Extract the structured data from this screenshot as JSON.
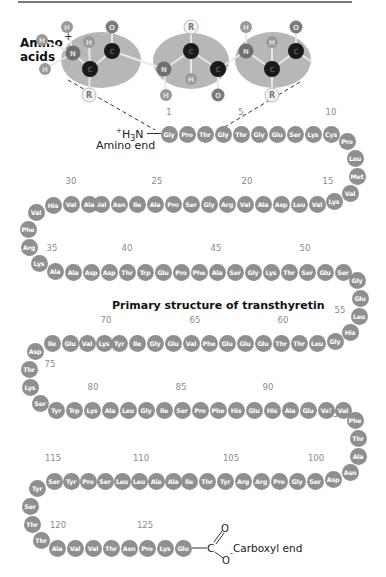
{
  "figure": {
    "heading_line1": "Amino",
    "heading_line2": "acids",
    "title": "Primary structure of transthyretin",
    "amino_end_prefix": "+",
    "amino_end_formula_h": "H",
    "amino_end_formula_sub": "3",
    "amino_end_formula_n": "N",
    "amino_end_label": "Amino end",
    "carboxyl_end_label": "Carboxyl end",
    "carboxyl_C": "C",
    "carboxyl_O_double": "O",
    "carboxyl_O_single": "O",
    "carboxyl_charge": "-",
    "colors": {
      "residue": "#8f8f8f",
      "residue_text": "#ffffff",
      "number_label": "#8a8a8a",
      "ellipse": "#b7b7b7",
      "carbon": "#1a1a1a",
      "nitrogen": "#6f6f6f",
      "oxygen": "#7a7a7a",
      "hydrogen": "#9a9a9a",
      "r_group": "#f2f2f2"
    }
  },
  "molecule": {
    "atoms": [
      {
        "label": "H",
        "type": "hydrogen",
        "x": 42,
        "y": 40
      },
      {
        "label": "H",
        "type": "hydrogen",
        "x": 67,
        "y": 27
      },
      {
        "label": "H",
        "type": "hydrogen",
        "x": 45,
        "y": 69
      },
      {
        "label": "N",
        "type": "nitrogen",
        "x": 73,
        "y": 53
      },
      {
        "label": "H",
        "type": "hydrogen",
        "x": 89,
        "y": 42
      },
      {
        "label": "C",
        "type": "carbon",
        "x": 90,
        "y": 69
      },
      {
        "label": "R",
        "type": "r_group",
        "x": 89,
        "y": 95
      },
      {
        "label": "C",
        "type": "carbon",
        "x": 112,
        "y": 51
      },
      {
        "label": "O",
        "type": "oxygen",
        "x": 112,
        "y": 27
      },
      {
        "label": "N",
        "type": "nitrogen",
        "x": 164,
        "y": 69
      },
      {
        "label": "H",
        "type": "hydrogen",
        "x": 166,
        "y": 95
      },
      {
        "label": "C",
        "type": "carbon",
        "x": 191,
        "y": 51
      },
      {
        "label": "R",
        "type": "r_group",
        "x": 191,
        "y": 27
      },
      {
        "label": "H",
        "type": "hydrogen",
        "x": 191,
        "y": 79
      },
      {
        "label": "C",
        "type": "carbon",
        "x": 218,
        "y": 69
      },
      {
        "label": "O",
        "type": "oxygen",
        "x": 218,
        "y": 95
      },
      {
        "label": "N",
        "type": "nitrogen",
        "x": 246,
        "y": 51
      },
      {
        "label": "H",
        "type": "hydrogen",
        "x": 246,
        "y": 27
      },
      {
        "label": "H",
        "type": "hydrogen",
        "x": 272,
        "y": 42
      },
      {
        "label": "C",
        "type": "carbon",
        "x": 272,
        "y": 69
      },
      {
        "label": "R",
        "type": "r_group",
        "x": 272,
        "y": 95
      },
      {
        "label": "C",
        "type": "carbon",
        "x": 296,
        "y": 51
      },
      {
        "label": "O",
        "type": "oxygen",
        "x": 296,
        "y": 27
      }
    ],
    "charge": "+"
  },
  "sequence": [
    {
      "n": 1,
      "aa": "Gly",
      "x": 169,
      "y": 134
    },
    {
      "n": 2,
      "aa": "Pro",
      "x": 187,
      "y": 134
    },
    {
      "n": 3,
      "aa": "Thr",
      "x": 205,
      "y": 134
    },
    {
      "n": 4,
      "aa": "Gly",
      "x": 223,
      "y": 134
    },
    {
      "n": 5,
      "aa": "Thr",
      "x": 241,
      "y": 134
    },
    {
      "n": 6,
      "aa": "Gly",
      "x": 259,
      "y": 134
    },
    {
      "n": 7,
      "aa": "Glu",
      "x": 277,
      "y": 134
    },
    {
      "n": 8,
      "aa": "Ser",
      "x": 295,
      "y": 134
    },
    {
      "n": 9,
      "aa": "Lys",
      "x": 313,
      "y": 134
    },
    {
      "n": 10,
      "aa": "Cys",
      "x": 331,
      "y": 134
    },
    {
      "n": 11,
      "aa": "Pro",
      "x": 347,
      "y": 141
    },
    {
      "n": 12,
      "aa": "Leu",
      "x": 355,
      "y": 158
    },
    {
      "n": 13,
      "aa": "Met",
      "x": 357,
      "y": 176
    },
    {
      "n": 14,
      "aa": "Val",
      "x": 350,
      "y": 193
    },
    {
      "n": 15,
      "aa": "Lys",
      "x": 334,
      "y": 201
    },
    {
      "n": 16,
      "aa": "Val",
      "x": 317,
      "y": 204
    },
    {
      "n": 17,
      "aa": "Leu",
      "x": 299,
      "y": 204
    },
    {
      "n": 18,
      "aa": "Asp",
      "x": 281,
      "y": 204
    },
    {
      "n": 19,
      "aa": "Ala",
      "x": 263,
      "y": 204
    },
    {
      "n": 20,
      "aa": "Val",
      "x": 245,
      "y": 204
    },
    {
      "n": 21,
      "aa": "Arg",
      "x": 227,
      "y": 204
    },
    {
      "n": 22,
      "aa": "Gly",
      "x": 209,
      "y": 204
    },
    {
      "n": 23,
      "aa": "Ser",
      "x": 191,
      "y": 204
    },
    {
      "n": 24,
      "aa": "Pro",
      "x": 173,
      "y": 204
    },
    {
      "n": 25,
      "aa": "Ala",
      "x": 155,
      "y": 204
    },
    {
      "n": 26,
      "aa": "Ile",
      "x": 137,
      "y": 204
    },
    {
      "n": 27,
      "aa": "Asn",
      "x": 119,
      "y": 204
    },
    {
      "n": 28,
      "aa": "Val",
      "x": 101,
      "y": 204
    },
    {
      "n": 29,
      "aa": "Ala",
      "x": 89,
      "y": 204
    },
    {
      "n": 30,
      "aa": "Val",
      "x": 71,
      "y": 204
    },
    {
      "n": 31,
      "aa": "His",
      "x": 53,
      "y": 205
    },
    {
      "n": 32,
      "aa": "Val",
      "x": 36,
      "y": 212
    },
    {
      "n": 33,
      "aa": "Phe",
      "x": 28,
      "y": 229
    },
    {
      "n": 34,
      "aa": "Arg",
      "x": 29,
      "y": 247
    },
    {
      "n": 35,
      "aa": "Lys",
      "x": 39,
      "y": 263
    },
    {
      "n": 36,
      "aa": "Ala",
      "x": 55,
      "y": 271
    },
    {
      "n": 37,
      "aa": "Ala",
      "x": 73,
      "y": 272
    },
    {
      "n": 38,
      "aa": "Asp",
      "x": 91,
      "y": 272
    },
    {
      "n": 39,
      "aa": "Asp",
      "x": 109,
      "y": 272
    },
    {
      "n": 40,
      "aa": "Thr",
      "x": 127,
      "y": 272
    },
    {
      "n": 41,
      "aa": "Trp",
      "x": 145,
      "y": 272
    },
    {
      "n": 42,
      "aa": "Glu",
      "x": 163,
      "y": 272
    },
    {
      "n": 43,
      "aa": "Pro",
      "x": 181,
      "y": 272
    },
    {
      "n": 44,
      "aa": "Phe",
      "x": 199,
      "y": 272
    },
    {
      "n": 45,
      "aa": "Ala",
      "x": 217,
      "y": 272
    },
    {
      "n": 46,
      "aa": "Ser",
      "x": 235,
      "y": 272
    },
    {
      "n": 47,
      "aa": "Gly",
      "x": 253,
      "y": 272
    },
    {
      "n": 48,
      "aa": "Lys",
      "x": 271,
      "y": 272
    },
    {
      "n": 49,
      "aa": "Thr",
      "x": 289,
      "y": 272
    },
    {
      "n": 50,
      "aa": "Ser",
      "x": 307,
      "y": 272
    },
    {
      "n": 51,
      "aa": "Glu",
      "x": 325,
      "y": 272
    },
    {
      "n": 52,
      "aa": "Ser",
      "x": 343,
      "y": 272
    },
    {
      "n": 53,
      "aa": "Gly",
      "x": 357,
      "y": 280
    },
    {
      "n": 54,
      "aa": "Glu",
      "x": 360,
      "y": 298
    },
    {
      "n": 55,
      "aa": "Leu",
      "x": 359,
      "y": 316
    },
    {
      "n": 56,
      "aa": "His",
      "x": 350,
      "y": 332
    },
    {
      "n": 57,
      "aa": "Gly",
      "x": 335,
      "y": 341
    },
    {
      "n": 58,
      "aa": "Leu",
      "x": 317,
      "y": 343
    },
    {
      "n": 59,
      "aa": "Thr",
      "x": 299,
      "y": 343
    },
    {
      "n": 60,
      "aa": "Thr",
      "x": 281,
      "y": 343
    },
    {
      "n": 61,
      "aa": "Glu",
      "x": 263,
      "y": 343
    },
    {
      "n": 62,
      "aa": "Glu",
      "x": 245,
      "y": 343
    },
    {
      "n": 63,
      "aa": "Glu",
      "x": 227,
      "y": 343
    },
    {
      "n": 64,
      "aa": "Phe",
      "x": 209,
      "y": 343
    },
    {
      "n": 65,
      "aa": "Val",
      "x": 191,
      "y": 343
    },
    {
      "n": 66,
      "aa": "Glu",
      "x": 173,
      "y": 343
    },
    {
      "n": 67,
      "aa": "Gly",
      "x": 155,
      "y": 343
    },
    {
      "n": 68,
      "aa": "Ile",
      "x": 137,
      "y": 343
    },
    {
      "n": 69,
      "aa": "Tyr",
      "x": 119,
      "y": 343
    },
    {
      "n": 70,
      "aa": "Lys",
      "x": 104,
      "y": 343
    },
    {
      "n": 71,
      "aa": "Val",
      "x": 87,
      "y": 343
    },
    {
      "n": 72,
      "aa": "Glu",
      "x": 70,
      "y": 343
    },
    {
      "n": 73,
      "aa": "Ile",
      "x": 52,
      "y": 343
    },
    {
      "n": 74,
      "aa": "Asp",
      "x": 35,
      "y": 351
    },
    {
      "n": 75,
      "aa": "Thr",
      "x": 29,
      "y": 369
    },
    {
      "n": 76,
      "aa": "Lys",
      "x": 30,
      "y": 387
    },
    {
      "n": 77,
      "aa": "Ser",
      "x": 40,
      "y": 403
    },
    {
      "n": 78,
      "aa": "Tyr",
      "x": 56,
      "y": 410
    },
    {
      "n": 79,
      "aa": "Trp",
      "x": 74,
      "y": 410
    },
    {
      "n": 80,
      "aa": "Lys",
      "x": 92,
      "y": 410
    },
    {
      "n": 81,
      "aa": "Ala",
      "x": 110,
      "y": 410
    },
    {
      "n": 82,
      "aa": "Leu",
      "x": 128,
      "y": 410
    },
    {
      "n": 83,
      "aa": "Gly",
      "x": 146,
      "y": 410
    },
    {
      "n": 84,
      "aa": "Ile",
      "x": 164,
      "y": 410
    },
    {
      "n": 85,
      "aa": "Ser",
      "x": 182,
      "y": 410
    },
    {
      "n": 86,
      "aa": "Pro",
      "x": 200,
      "y": 410
    },
    {
      "n": 87,
      "aa": "Phe",
      "x": 218,
      "y": 410
    },
    {
      "n": 88,
      "aa": "His",
      "x": 236,
      "y": 410
    },
    {
      "n": 89,
      "aa": "Glu",
      "x": 254,
      "y": 410
    },
    {
      "n": 90,
      "aa": "His",
      "x": 272,
      "y": 410
    },
    {
      "n": 91,
      "aa": "Ala",
      "x": 290,
      "y": 410
    },
    {
      "n": 92,
      "aa": "Glu",
      "x": 308,
      "y": 410
    },
    {
      "n": 93,
      "aa": "Val",
      "x": 326,
      "y": 410
    },
    {
      "n": 94,
      "aa": "Val",
      "x": 343,
      "y": 410
    },
    {
      "n": 95,
      "aa": "Phe",
      "x": 355,
      "y": 420
    },
    {
      "n": 96,
      "aa": "Thr",
      "x": 358,
      "y": 438
    },
    {
      "n": 97,
      "aa": "Ala",
      "x": 358,
      "y": 456
    },
    {
      "n": 98,
      "aa": "Asn",
      "x": 350,
      "y": 472
    },
    {
      "n": 99,
      "aa": "Asp",
      "x": 333,
      "y": 479
    },
    {
      "n": 100,
      "aa": "Ser",
      "x": 315,
      "y": 481
    },
    {
      "n": 101,
      "aa": "Gly",
      "x": 297,
      "y": 481
    },
    {
      "n": 102,
      "aa": "Pro",
      "x": 279,
      "y": 481
    },
    {
      "n": 103,
      "aa": "Arg",
      "x": 261,
      "y": 481
    },
    {
      "n": 104,
      "aa": "Arg",
      "x": 243,
      "y": 481
    },
    {
      "n": 105,
      "aa": "Tyr",
      "x": 225,
      "y": 481
    },
    {
      "n": 106,
      "aa": "Thr",
      "x": 207,
      "y": 481
    },
    {
      "n": 107,
      "aa": "Ile",
      "x": 189,
      "y": 481
    },
    {
      "n": 108,
      "aa": "Ala",
      "x": 173,
      "y": 481
    },
    {
      "n": 109,
      "aa": "Ala",
      "x": 156,
      "y": 481
    },
    {
      "n": 110,
      "aa": "Leu",
      "x": 139,
      "y": 481
    },
    {
      "n": 111,
      "aa": "Leu",
      "x": 122,
      "y": 481
    },
    {
      "n": 112,
      "aa": "Ser",
      "x": 105,
      "y": 481
    },
    {
      "n": 113,
      "aa": "Pro",
      "x": 88,
      "y": 481
    },
    {
      "n": 114,
      "aa": "Tyr",
      "x": 71,
      "y": 481
    },
    {
      "n": 115,
      "aa": "Ser",
      "x": 54,
      "y": 481
    },
    {
      "n": 116,
      "aa": "Tyr",
      "x": 37,
      "y": 488
    },
    {
      "n": 117,
      "aa": "Ser",
      "x": 30,
      "y": 506
    },
    {
      "n": 118,
      "aa": "Thr",
      "x": 32,
      "y": 524
    },
    {
      "n": 119,
      "aa": "Thr",
      "x": 41,
      "y": 540
    },
    {
      "n": 120,
      "aa": "Ala",
      "x": 57,
      "y": 548
    },
    {
      "n": 121,
      "aa": "Val",
      "x": 75,
      "y": 548
    },
    {
      "n": 122,
      "aa": "Val",
      "x": 93,
      "y": 548
    },
    {
      "n": 123,
      "aa": "Thr",
      "x": 111,
      "y": 548
    },
    {
      "n": 124,
      "aa": "Asn",
      "x": 129,
      "y": 548
    },
    {
      "n": 125,
      "aa": "Pro",
      "x": 147,
      "y": 548
    },
    {
      "n": 126,
      "aa": "Lys",
      "x": 165,
      "y": 548
    },
    {
      "n": 127,
      "aa": "Glu",
      "x": 183,
      "y": 548
    }
  ],
  "number_labels": [
    {
      "text": "1",
      "x": 169,
      "y": 113
    },
    {
      "text": "5",
      "x": 241,
      "y": 113
    },
    {
      "text": "10",
      "x": 331,
      "y": 113
    },
    {
      "text": "15",
      "x": 328,
      "y": 182
    },
    {
      "text": "20",
      "x": 247,
      "y": 182
    },
    {
      "text": "25",
      "x": 157,
      "y": 182
    },
    {
      "text": "30",
      "x": 71,
      "y": 182
    },
    {
      "text": "35",
      "x": 52,
      "y": 249
    },
    {
      "text": "40",
      "x": 127,
      "y": 249
    },
    {
      "text": "45",
      "x": 216,
      "y": 249
    },
    {
      "text": "50",
      "x": 305,
      "y": 249
    },
    {
      "text": "55",
      "x": 340,
      "y": 311
    },
    {
      "text": "60",
      "x": 283,
      "y": 321
    },
    {
      "text": "65",
      "x": 195,
      "y": 321
    },
    {
      "text": "70",
      "x": 106,
      "y": 321
    },
    {
      "text": "75",
      "x": 50,
      "y": 365
    },
    {
      "text": "80",
      "x": 93,
      "y": 388
    },
    {
      "text": "85",
      "x": 181,
      "y": 388
    },
    {
      "text": "90",
      "x": 268,
      "y": 388
    },
    {
      "text": "95",
      "x": 333,
      "y": 415
    },
    {
      "text": "100",
      "x": 316,
      "y": 459
    },
    {
      "text": "105",
      "x": 231,
      "y": 459
    },
    {
      "text": "110",
      "x": 141,
      "y": 459
    },
    {
      "text": "115",
      "x": 53,
      "y": 459
    },
    {
      "text": "120",
      "x": 58,
      "y": 526
    },
    {
      "text": "125",
      "x": 145,
      "y": 526
    }
  ]
}
